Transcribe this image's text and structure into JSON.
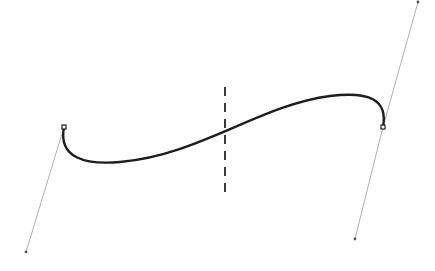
{
  "canvas": {
    "width": 435,
    "height": 271,
    "background": "#ffffff"
  },
  "colors": {
    "curve": "#1e1e1e",
    "handle_line": "#9a9a9a",
    "guide": "#3a3a3a",
    "control_point": "#555555"
  },
  "path": {
    "type": "cubic-bezier",
    "d": "M 64 127 C 58 158, 85 165, 120 162 C 200 155, 260 105, 330 96 C 370 91, 388 100, 383 127",
    "anchors": [
      {
        "id": "anchor-left",
        "x": 64,
        "y": 127
      },
      {
        "id": "anchor-right",
        "x": 383,
        "y": 127
      }
    ],
    "handles": [
      {
        "id": "handle-left",
        "from": [
          64,
          127
        ],
        "to": [
          26,
          252
        ]
      },
      {
        "id": "handle-right-upper",
        "from": [
          383,
          127
        ],
        "to": [
          418,
          2
        ]
      },
      {
        "id": "handle-right-lower",
        "from": [
          383,
          127
        ],
        "to": [
          355,
          239
        ]
      }
    ]
  },
  "guide": {
    "orientation": "vertical",
    "x": 225,
    "y1": 87,
    "y2": 196
  }
}
